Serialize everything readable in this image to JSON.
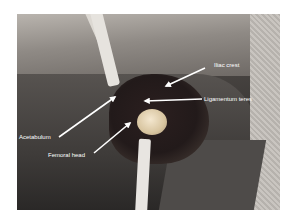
{
  "figure": {
    "labels": {
      "iliac_crest": "Iliac crest",
      "ligamentum_teres": "Ligamentum teres",
      "acetabulum": "Acetabulum",
      "femoral_head": "Femoral head"
    },
    "colors": {
      "label_text": "#ffffff",
      "arrow": "#ffffff",
      "background": "#ffffff"
    }
  }
}
